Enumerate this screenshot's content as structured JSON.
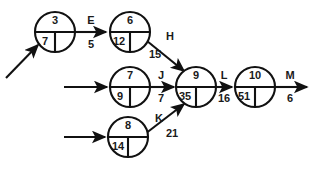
{
  "diagram": {
    "stroke_color": "#111111",
    "text_color": "#1a1a1a",
    "background_color": "#ffffff",
    "nodes": [
      {
        "id": "n1",
        "top": "3",
        "bottom_left": "7",
        "bottom_right": "",
        "cx": 55,
        "cy": 32,
        "r": 20
      },
      {
        "id": "n2",
        "top": "6",
        "bottom_left": "12",
        "bottom_right": "",
        "cx": 130,
        "cy": 32,
        "r": 20
      },
      {
        "id": "n3",
        "top": "7",
        "bottom_left": "9",
        "bottom_right": "",
        "cx": 130,
        "cy": 87,
        "r": 20
      },
      {
        "id": "n4",
        "top": "9",
        "bottom_left": "35",
        "bottom_right": "",
        "cx": 196,
        "cy": 87,
        "r": 20
      },
      {
        "id": "n5",
        "top": "10",
        "bottom_left": "51",
        "bottom_right": "",
        "cx": 255,
        "cy": 87,
        "r": 20
      },
      {
        "id": "n6",
        "top": "8",
        "bottom_left": "14",
        "bottom_right": "",
        "cx": 128,
        "cy": 137,
        "r": 20
      }
    ],
    "edges": [
      {
        "id": "e_start_n1",
        "label": "",
        "duration": "",
        "from": "n1",
        "to": "n1"
      },
      {
        "id": "e_E",
        "label": "E",
        "duration": "5",
        "from": "n1",
        "to": "n2"
      },
      {
        "id": "e_H",
        "label": "H",
        "duration": "15",
        "from": "n2",
        "to": "n4"
      },
      {
        "id": "e_start_n3",
        "label": "",
        "duration": "",
        "from": "n3",
        "to": "n3"
      },
      {
        "id": "e_J",
        "label": "J",
        "duration": "7",
        "from": "n3",
        "to": "n4"
      },
      {
        "id": "e_start_n6",
        "label": "",
        "duration": "",
        "from": "n6",
        "to": "n6"
      },
      {
        "id": "e_K",
        "label": "K",
        "duration": "21",
        "from": "n6",
        "to": "n4"
      },
      {
        "id": "e_L",
        "label": "L",
        "duration": "16",
        "from": "n4",
        "to": "n5"
      },
      {
        "id": "e_M",
        "label": "M",
        "duration": "6",
        "from": "n5",
        "to": "end"
      }
    ],
    "edge_labels": {
      "E": "E",
      "H": "H",
      "J": "J",
      "K": "K",
      "L": "L",
      "M": "M"
    },
    "edge_durations": {
      "E": "5",
      "H": "15",
      "J": "7",
      "K": "21",
      "L": "16",
      "M": "6"
    },
    "node_values": {
      "n1_top": "3",
      "n1_bottom": "7",
      "n2_top": "6",
      "n2_bottom": "12",
      "n3_top": "7",
      "n3_bottom": "9",
      "n4_top": "9",
      "n4_bottom": "35",
      "n5_top": "10",
      "n5_bottom": "51",
      "n6_top": "8",
      "n6_bottom": "14"
    }
  }
}
